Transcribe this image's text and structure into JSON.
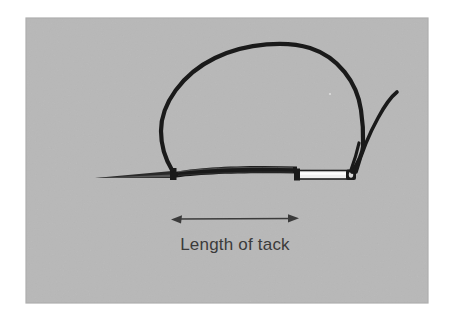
{
  "figure": {
    "kind": "photograph-illustration",
    "caption": "Length of tack",
    "photo_background_color": "#b8b8b8",
    "page_background_color": "#ffffff",
    "ink_color": "#1a1a1a",
    "needle_body_color": "#efefef",
    "annotation_color": "#3b3b3b",
    "photo_area": {
      "x": 26,
      "y": 18,
      "width": 402,
      "height": 285
    },
    "parts": [
      {
        "name": "needle-point",
        "label": "Needle point"
      },
      {
        "name": "needle-shaft",
        "label": "Needle shaft"
      },
      {
        "name": "needle-eye",
        "label": "Needle eye"
      },
      {
        "name": "tack-stitch",
        "label": "Tack stitch"
      },
      {
        "name": "thread-loop",
        "label": "Thread loop"
      },
      {
        "name": "thread-tail",
        "label": "Thread tail"
      }
    ],
    "dimension": {
      "label": "Length of tack",
      "arrow_left_x": 172,
      "arrow_right_x": 298,
      "arrow_y": 219
    }
  }
}
